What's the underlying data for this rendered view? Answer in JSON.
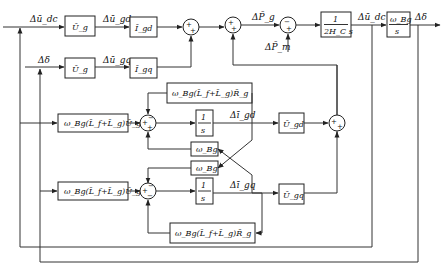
{
  "diagram": {
    "type": "control-block-diagram",
    "signals": {
      "u_dc_in": "Δū_dc",
      "u_gd": "Δū_gd",
      "delta_in": "Δδ",
      "u_gq": "Δū_gq",
      "P_g": "ΔP̄_g",
      "P_m": "ΔP̄_m",
      "u_dc_out": "Δū_dc",
      "delta_out": "Δδ",
      "i_gd": "Δī_gd",
      "i_gq": "Δī_gq"
    },
    "blocks": {
      "Ug_top": "Ū_g",
      "Igd": "Ī_gd",
      "Ug_mid": "Ū_g",
      "Igq": "Ī_gq",
      "inertia_num": "1",
      "inertia_den": "2H_C s",
      "integ_num": "ω_Bg",
      "integ_den": "s",
      "d_gain_in": "ω_Bg(L̄_f+L̄_g)Ū_g",
      "d_R_feedback": "ω_Bg(L̄_f+L̄_g)R̄_g",
      "d_integ_num": "1",
      "d_integ_den": "s",
      "cross_wBg_top": "ω_Bg",
      "cross_wBg_bot": "ω_Bg",
      "q_gain_in": "ω_Bg(L̄_f+L̄_g)Ū_g",
      "q_integ_num": "1",
      "q_integ_den": "s",
      "q_R_feedback": "ω_Bg(L̄_f+L̄_g)R̄_g",
      "Ugd": "Ū_gd",
      "Ugq": "Ū_gq"
    },
    "signs": {
      "sum1": [
        "+",
        "+"
      ],
      "sum2": [
        "+",
        "+"
      ],
      "sum3": [
        "−",
        "+"
      ],
      "sum_d": [
        "+",
        "−",
        "+"
      ],
      "sum_q": [
        "+",
        "−",
        "−"
      ],
      "sum_out": [
        "+",
        "+"
      ]
    }
  }
}
